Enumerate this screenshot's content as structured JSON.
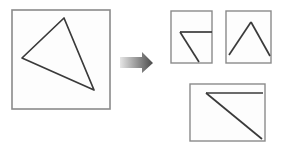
{
  "figure": {
    "title": "",
    "background_color": "#ffffff",
    "stroke_color": "#3a3a3a",
    "panel_border_color": "#8a8a8a",
    "panel_fill_color": "#fdfdfd",
    "arrow_gradient_from": "#e6e6e6",
    "arrow_gradient_to": "#4a4a4a"
  },
  "source_panel": {
    "label": "source-square",
    "square": {
      "x": 12,
      "y": 10,
      "width": 98,
      "height": 99
    },
    "shape": {
      "name": "triangle",
      "points": "64,18 22,58 94,90",
      "vertices": [
        {
          "name": "apex",
          "x": 64,
          "y": 18
        },
        {
          "name": "left",
          "x": 22,
          "y": 58
        },
        {
          "name": "bottom-right",
          "x": 94,
          "y": 90
        }
      ]
    }
  },
  "arrow": {
    "label": "transform-arrow",
    "direction": "right",
    "points": "120,57 142,57 142,52 153,63 142,73 142,68 120,68",
    "bounds": {
      "x": 120,
      "y": 52,
      "width": 33,
      "height": 21
    }
  },
  "result_panels": [
    {
      "label": "panel-one",
      "square": {
        "x": 171,
        "y": 11,
        "width": 41,
        "height": 52
      },
      "strokes": [
        {
          "name": "horizontal-edge",
          "points": "180,32 212,32"
        },
        {
          "name": "diagonal-edge",
          "points": "180,32 199,62"
        }
      ]
    },
    {
      "label": "panel-two",
      "square": {
        "x": 226,
        "y": 11,
        "width": 45,
        "height": 52
      },
      "strokes": [
        {
          "name": "left-ascending-edge",
          "points": "229,55 251,22"
        },
        {
          "name": "right-descending-edge",
          "points": "251,22 270,56"
        }
      ]
    },
    {
      "label": "panel-three",
      "square": {
        "x": 190,
        "y": 84,
        "width": 75,
        "height": 57
      },
      "strokes": [
        {
          "name": "horizontal-edge",
          "points": "206,93 263,93"
        },
        {
          "name": "diagonal-edge",
          "points": "206,93 262,139"
        }
      ]
    }
  ]
}
